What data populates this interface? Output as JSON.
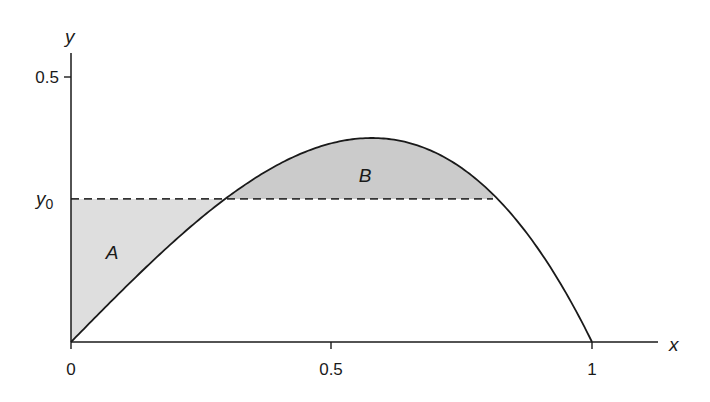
{
  "chart_data": {
    "type": "area",
    "title": "",
    "xlabel": "x",
    "ylabel": "y",
    "curve": "y = x(1 - x^2)",
    "x_ticks": [
      0,
      0.5,
      1
    ],
    "x_tick_labels": [
      "0",
      "0.5",
      "1"
    ],
    "y_ticks": [
      0.5
    ],
    "y_tick_labels": [
      "0.5"
    ],
    "xlim": [
      0,
      1.13
    ],
    "ylim": [
      0,
      0.53
    ],
    "grid": false,
    "horizontal_line": {
      "label": "y0",
      "value": 0.27,
      "style": "dashed"
    },
    "intersections_x": [
      0.3,
      0.81
    ],
    "peak": {
      "x": 0.577,
      "y": 0.385
    },
    "regions": [
      {
        "name": "A",
        "description": "between y-axis, y = y0 and curve for x in [0, 0.30]",
        "fill": "#dedede"
      },
      {
        "name": "B",
        "description": "between curve and y = y0 for x in [0.30, 0.81]",
        "fill": "#cbcbcb"
      }
    ],
    "sample_points": [
      {
        "x": 0.0,
        "y": 0.0
      },
      {
        "x": 0.1,
        "y": 0.099
      },
      {
        "x": 0.2,
        "y": 0.192
      },
      {
        "x": 0.3,
        "y": 0.273
      },
      {
        "x": 0.4,
        "y": 0.336
      },
      {
        "x": 0.5,
        "y": 0.375
      },
      {
        "x": 0.577,
        "y": 0.385
      },
      {
        "x": 0.6,
        "y": 0.384
      },
      {
        "x": 0.7,
        "y": 0.357
      },
      {
        "x": 0.8,
        "y": 0.288
      },
      {
        "x": 0.9,
        "y": 0.171
      },
      {
        "x": 1.0,
        "y": 0.0
      }
    ]
  },
  "labels": {
    "x_axis": "x",
    "y_axis": "y",
    "y_tick": "0.5",
    "y0_main": "y",
    "y0_sub": "0",
    "x_tick_0": "0",
    "x_tick_05": "0.5",
    "x_tick_1": "1",
    "region_a": "A",
    "region_b": "B"
  },
  "colors": {
    "axis": "#1a1a1a",
    "curve": "#1a1a1a",
    "region_a_fill": "#dedede",
    "region_b_fill": "#cbcbcb"
  }
}
